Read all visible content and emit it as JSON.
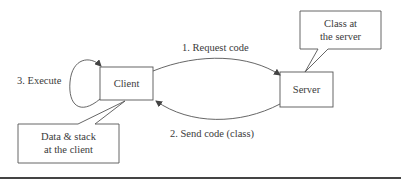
{
  "diagram": {
    "nodes": {
      "client": {
        "label": "Client"
      },
      "server": {
        "label": "Server"
      }
    },
    "callouts": {
      "server_class": {
        "line1": "Class at",
        "line2": "the server"
      },
      "client_data": {
        "line1": "Data & stack",
        "line2": "at the client"
      }
    },
    "edges": {
      "request": {
        "label": "1. Request code",
        "from": "client",
        "to": "server"
      },
      "send": {
        "label": "2. Send code (class)",
        "from": "server",
        "to": "client"
      },
      "execute": {
        "label": "3. Execute",
        "from": "client",
        "to": "client"
      }
    },
    "colors": {
      "stroke": "#555555",
      "text": "#3a3a3a",
      "rule": "#444444"
    }
  }
}
